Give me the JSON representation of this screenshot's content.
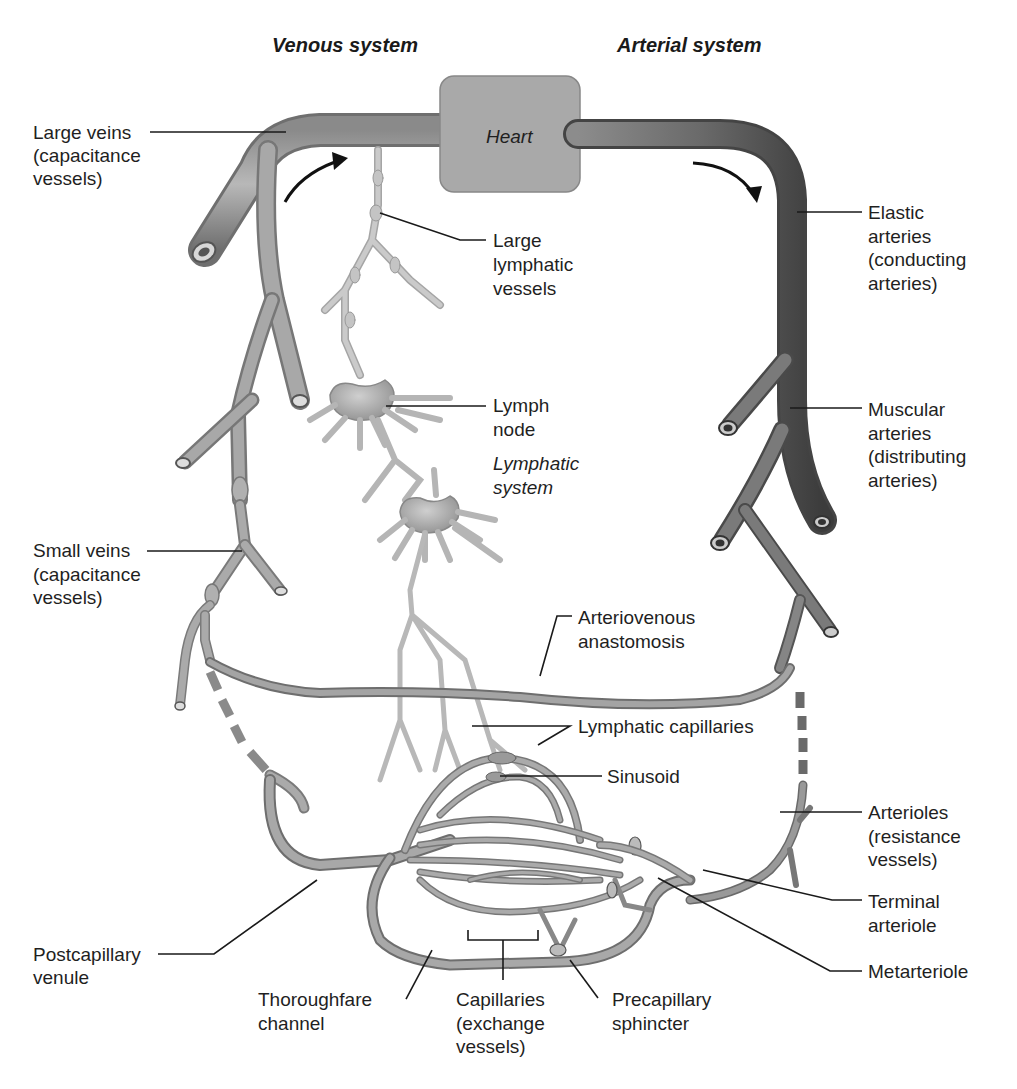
{
  "diagram": {
    "title_left": "Venous system",
    "title_right": "Arterial system",
    "heart_label": "Heart",
    "lymphatic_system_label": [
      "Lymphatic",
      "system"
    ],
    "labels": {
      "large_veins": [
        "Large veins",
        "(capacitance",
        "vessels)"
      ],
      "small_veins": [
        "Small veins",
        "(capacitance",
        "vessels)"
      ],
      "postcapillary_venule": [
        "Postcapillary",
        "venule"
      ],
      "thoroughfare_channel": [
        "Thoroughfare",
        "channel"
      ],
      "capillaries": [
        "Capillaries",
        "(exchange",
        "vessels)"
      ],
      "precapillary_sphincter": [
        "Precapillary",
        "sphincter"
      ],
      "metarteriole": [
        "Metarteriole"
      ],
      "terminal_arteriole": [
        "Terminal",
        "arteriole"
      ],
      "arterioles": [
        "Arterioles",
        "(resistance",
        "vessels)"
      ],
      "sinusoid": [
        "Sinusoid"
      ],
      "lymphatic_capillaries": [
        "Lymphatic capillaries"
      ],
      "arteriovenous_anastomosis": [
        "Arteriovenous",
        "anastomosis"
      ],
      "muscular_arteries": [
        "Muscular",
        "arteries",
        "(distributing",
        "arteries)"
      ],
      "elastic_arteries": [
        "Elastic",
        "arteries",
        "(conducting",
        "arteries)"
      ],
      "large_lymphatic_vessels": [
        "Large",
        "lymphatic",
        "vessels"
      ],
      "lymph_node": [
        "Lymph",
        "node"
      ]
    },
    "colors": {
      "vessel_fill": "#9a9a9a",
      "vessel_dark": "#5a5a5a",
      "artery_dark": "#4a4a4a",
      "lymph_fill": "#bdbdbd",
      "heart_fill": "#a8a8a8",
      "text": "#1f1f1f"
    }
  }
}
